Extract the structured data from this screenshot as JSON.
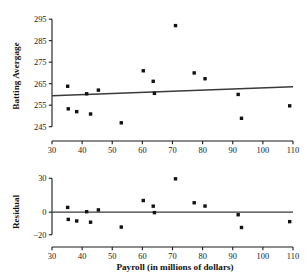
{
  "chart_data": [
    {
      "id": "scatter_batting",
      "type": "scatter",
      "title": "",
      "xlabel": "",
      "ylabel": "Batting Avergage",
      "xlim": [
        30,
        110
      ],
      "ylim": [
        243,
        296
      ],
      "xticks": [
        30,
        40,
        50,
        60,
        70,
        80,
        90,
        100,
        110
      ],
      "yticks": [
        245,
        255,
        265,
        275,
        285,
        295
      ],
      "xticklabels": [
        "30",
        "40",
        "50",
        "60",
        "70",
        "80",
        "90",
        "100",
        "110"
      ],
      "yticklabels": [
        "245",
        "255",
        "265",
        "275",
        "285",
        "295"
      ],
      "grid": false,
      "legend": "none",
      "points": [
        {
          "x": 35.2,
          "y": 263.8
        },
        {
          "x": 35.4,
          "y": 253.3
        },
        {
          "x": 38.2,
          "y": 252.0
        },
        {
          "x": 41.5,
          "y": 260.3
        },
        {
          "x": 42.8,
          "y": 250.9
        },
        {
          "x": 45.4,
          "y": 262.0
        },
        {
          "x": 53.0,
          "y": 246.8
        },
        {
          "x": 60.3,
          "y": 271.0
        },
        {
          "x": 63.6,
          "y": 266.1
        },
        {
          "x": 64.0,
          "y": 260.5
        },
        {
          "x": 71.0,
          "y": 292.0
        },
        {
          "x": 77.2,
          "y": 270.0
        },
        {
          "x": 80.8,
          "y": 267.3
        },
        {
          "x": 91.8,
          "y": 260.0
        },
        {
          "x": 92.9,
          "y": 248.9
        },
        {
          "x": 108.9,
          "y": 254.7
        }
      ],
      "fit_line": {
        "x1": 30,
        "y1": 259.4,
        "x2": 110,
        "y2": 263.6
      }
    },
    {
      "id": "residual_plot",
      "type": "scatter",
      "title": "",
      "xlabel": "Payroll (in millions of dollars)",
      "ylabel": "Residual",
      "xlim": [
        30,
        110
      ],
      "ylim": [
        -22,
        32
      ],
      "xticks": [
        30,
        40,
        50,
        60,
        70,
        80,
        90,
        100,
        110
      ],
      "yticks": [
        -20,
        0,
        30
      ],
      "xticklabels": [
        "30",
        "40",
        "50",
        "60",
        "70",
        "80",
        "90",
        "100",
        "110"
      ],
      "yticklabels": [
        "−20",
        "0",
        "30"
      ],
      "grid": false,
      "legend": "none",
      "reference_line_y": 0,
      "points": [
        {
          "x": 35.2,
          "y": 4.2
        },
        {
          "x": 35.4,
          "y": -6.4
        },
        {
          "x": 38.2,
          "y": -7.8
        },
        {
          "x": 41.5,
          "y": 0.4
        },
        {
          "x": 42.8,
          "y": -8.9
        },
        {
          "x": 45.4,
          "y": 2.0
        },
        {
          "x": 53.0,
          "y": -13.2
        },
        {
          "x": 60.3,
          "y": 10.3
        },
        {
          "x": 63.6,
          "y": 5.3
        },
        {
          "x": 64.0,
          "y": -0.4
        },
        {
          "x": 71.0,
          "y": 29.5
        },
        {
          "x": 77.2,
          "y": 8.3
        },
        {
          "x": 80.8,
          "y": 5.4
        },
        {
          "x": 91.8,
          "y": -2.3
        },
        {
          "x": 92.9,
          "y": -13.6
        },
        {
          "x": 108.9,
          "y": -8.4
        }
      ]
    }
  ],
  "labels": {
    "y_top": "Batting Avergage",
    "y_bottom": "Residual",
    "x_axis": "Payroll (in millions of dollars)"
  }
}
